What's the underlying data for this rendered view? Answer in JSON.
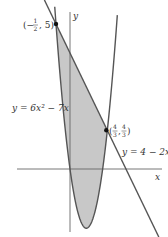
{
  "figure": {
    "axes": {
      "x_label": "x",
      "y_label": "y"
    },
    "curves": [
      {
        "id": "parabola",
        "label": "y = 6x² − 7x",
        "equation": "y = 6x^2 - 7x"
      },
      {
        "id": "line",
        "label": "y = 4 − 2x",
        "equation": "y = 4 - 2x"
      }
    ],
    "points": [
      {
        "label": "(−½, 5)",
        "x": -0.5,
        "y": 5
      },
      {
        "label": "(4/3, 4/3)",
        "x": 1.3333,
        "y": 1.3333
      }
    ],
    "shaded_region": "between line y = 4 - 2x and parabola y = 6x^2 - 7x from x = -1/2 to x = 4/3",
    "colors": {
      "stroke": "#555555",
      "fill": "#c8c8c8",
      "axis": "#666666",
      "point": "#111111"
    }
  }
}
